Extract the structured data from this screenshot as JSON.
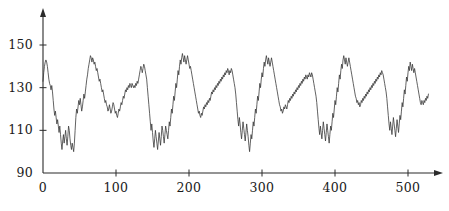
{
  "chart_data": {
    "type": "line",
    "title": "",
    "subtitle": "",
    "xlabel": "",
    "ylabel": "",
    "xlim": [
      0,
      520
    ],
    "ylim": [
      90,
      158
    ],
    "xticks": [
      0,
      100,
      200,
      300,
      400,
      500
    ],
    "xtick_labels": [
      "0",
      "100",
      "200",
      "300",
      "400",
      "500"
    ],
    "yticks": [
      90,
      110,
      130,
      150
    ],
    "ytick_labels": [
      "90",
      "110",
      "130",
      "150"
    ],
    "grid": false,
    "legend": null,
    "axis_style": "arrow-terminated-spines",
    "line_color": "#3a3a3a",
    "line_width": 0.8,
    "series": [
      {
        "name": "series-1",
        "x_start": 0,
        "x_step": 1,
        "values": [
          133,
          137,
          140,
          142,
          143,
          142,
          140,
          137,
          134,
          132,
          131,
          129,
          131,
          128,
          124,
          120,
          117,
          119,
          116,
          113,
          115,
          112,
          109,
          112,
          108,
          104,
          101,
          105,
          108,
          104,
          107,
          110,
          106,
          103,
          107,
          112,
          110,
          106,
          103,
          101,
          104,
          102,
          100,
          104,
          110,
          116,
          120,
          118,
          121,
          124,
          122,
          125,
          122,
          119,
          121,
          124,
          127,
          125,
          128,
          131,
          134,
          136,
          139,
          141,
          143,
          145,
          144,
          142,
          144,
          143,
          141,
          142,
          140,
          138,
          139,
          137,
          135,
          133,
          134,
          132,
          130,
          128,
          129,
          127,
          125,
          123,
          124,
          122,
          121,
          119,
          120,
          122,
          120,
          118,
          119,
          121,
          123,
          122,
          120,
          118,
          119,
          117,
          116,
          118,
          120,
          119,
          121,
          123,
          122,
          124,
          126,
          125,
          127,
          129,
          128,
          130,
          129,
          131,
          130,
          132,
          131,
          130,
          132,
          131,
          130,
          131,
          130,
          132,
          131,
          133,
          132,
          134,
          136,
          138,
          140,
          139,
          137,
          139,
          141,
          140,
          138,
          136,
          134,
          130,
          126,
          122,
          118,
          114,
          110,
          113,
          109,
          105,
          102,
          106,
          110,
          107,
          104,
          101,
          105,
          109,
          106,
          103,
          107,
          112,
          110,
          107,
          104,
          108,
          112,
          110,
          108,
          106,
          110,
          114,
          112,
          116,
          120,
          118,
          122,
          126,
          124,
          128,
          132,
          130,
          134,
          138,
          136,
          140,
          143,
          141,
          144,
          146,
          144,
          142,
          145,
          143,
          141,
          143,
          145,
          143,
          141,
          139,
          140,
          138,
          136,
          134,
          132,
          130,
          128,
          126,
          124,
          122,
          120,
          118,
          119,
          117,
          116,
          118,
          117,
          119,
          121,
          120,
          122,
          121,
          123,
          122,
          124,
          123,
          125,
          124,
          126,
          128,
          127,
          129,
          128,
          130,
          129,
          131,
          130,
          132,
          131,
          133,
          132,
          134,
          133,
          135,
          134,
          136,
          135,
          137,
          136,
          138,
          137,
          139,
          138,
          136,
          138,
          137,
          139,
          138,
          136,
          134,
          132,
          130,
          127,
          123,
          119,
          115,
          112,
          116,
          113,
          109,
          106,
          110,
          114,
          111,
          108,
          105,
          109,
          113,
          110,
          107,
          103,
          100,
          104,
          108,
          106,
          110,
          114,
          112,
          116,
          120,
          118,
          122,
          126,
          124,
          128,
          132,
          130,
          134,
          137,
          135,
          139,
          142,
          140,
          143,
          145,
          143,
          141,
          144,
          142,
          140,
          142,
          144,
          142,
          140,
          138,
          136,
          134,
          132,
          130,
          128,
          126,
          124,
          122,
          121,
          119,
          120,
          118,
          119,
          121,
          120,
          122,
          121,
          120,
          122,
          124,
          123,
          125,
          124,
          126,
          125,
          127,
          126,
          128,
          127,
          129,
          128,
          130,
          129,
          131,
          130,
          132,
          131,
          133,
          132,
          134,
          133,
          135,
          134,
          136,
          135,
          134,
          136,
          135,
          137,
          136,
          135,
          137,
          136,
          134,
          132,
          130,
          128,
          126,
          123,
          119,
          115,
          111,
          108,
          112,
          109,
          106,
          110,
          114,
          111,
          108,
          105,
          109,
          113,
          110,
          107,
          104,
          108,
          112,
          110,
          114,
          118,
          116,
          120,
          124,
          122,
          126,
          130,
          128,
          132,
          136,
          134,
          138,
          141,
          139,
          143,
          145,
          143,
          141,
          144,
          142,
          140,
          142,
          144,
          142,
          140,
          138,
          136,
          134,
          132,
          130,
          128,
          126,
          125,
          123,
          124,
          122,
          123,
          121,
          122,
          124,
          123,
          125,
          124,
          126,
          125,
          127,
          126,
          128,
          127,
          129,
          128,
          130,
          129,
          131,
          130,
          132,
          131,
          133,
          132,
          134,
          133,
          135,
          134,
          136,
          135,
          137,
          136,
          138,
          137,
          136,
          134,
          132,
          130,
          128,
          125,
          121,
          117,
          113,
          110,
          114,
          111,
          108,
          112,
          116,
          113,
          110,
          107,
          111,
          115,
          112,
          109,
          113,
          117,
          115,
          119,
          123,
          121,
          125,
          129,
          127,
          131,
          135,
          133,
          137,
          140,
          138,
          142,
          140,
          138,
          141,
          139,
          137,
          139,
          137,
          135,
          133,
          131,
          129,
          127,
          125,
          123,
          122,
          124,
          123,
          122,
          124,
          123,
          125,
          124,
          126,
          125,
          127
        ]
      }
    ]
  }
}
